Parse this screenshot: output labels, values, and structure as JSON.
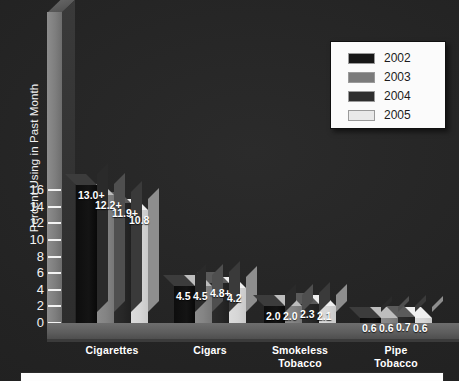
{
  "chart_data": {
    "type": "bar",
    "title": "",
    "xlabel": "",
    "ylabel": "Percent Using in Past Month",
    "ylim": [
      0,
      16
    ],
    "yticks": [
      0,
      2,
      4,
      6,
      8,
      10,
      12,
      14,
      16
    ],
    "ytick_labels": [
      "0",
      "2",
      "4",
      "6",
      "8",
      "10",
      "12",
      "14",
      "16"
    ],
    "grid": false,
    "legend_position": "top-right",
    "categories": [
      "Cigarettes",
      "Cigars",
      "Smokeless Tobacco",
      "Pipe Tobacco"
    ],
    "category_lines": [
      [
        "Cigarettes"
      ],
      [
        "Cigars"
      ],
      [
        "Smokeless",
        "Tobacco"
      ],
      [
        "Pipe",
        "Tobacco"
      ]
    ],
    "series": [
      {
        "name": "2002",
        "color": "#111111",
        "values": [
          16.6,
          4.5,
          2.0,
          0.6
        ],
        "labels": [
          "13.0+",
          "4.5",
          "2.0",
          "0.6"
        ]
      },
      {
        "name": "2003",
        "color": "#848484",
        "values": [
          15.4,
          4.5,
          2.0,
          0.6
        ],
        "labels": [
          "12.2+",
          "4.5",
          "2.0",
          "0.6"
        ]
      },
      {
        "name": "2004",
        "color": "#282828",
        "values": [
          14.4,
          4.8,
          2.3,
          0.7
        ],
        "labels": [
          "11.9+",
          "4.8+",
          "2.3",
          "0.7"
        ]
      },
      {
        "name": "2005",
        "color": "#d6d6d6",
        "values": [
          13.6,
          4.2,
          2.1,
          0.6
        ],
        "labels": [
          "10.8",
          "4.2",
          "2.1",
          "0.6"
        ]
      }
    ]
  },
  "legend": {
    "entries": [
      {
        "label": "2002",
        "color": "#171717"
      },
      {
        "label": "2003",
        "color": "#7b7b7b"
      },
      {
        "label": "2004",
        "color": "#2e2e2e"
      },
      {
        "label": "2005",
        "color": "#e9e9e9"
      }
    ]
  },
  "axis": {
    "y_title": "Percent Using in Past Month",
    "ticks": [
      "16",
      "14",
      "12",
      "10",
      "8",
      "6",
      "4",
      "2",
      "0"
    ]
  }
}
